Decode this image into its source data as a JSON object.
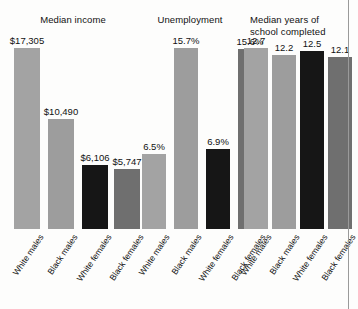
{
  "figure": {
    "background_color": "#fdfdfc",
    "rule_color": "#9a9a9a",
    "text_color": "#111111"
  },
  "categories": [
    "White males",
    "Black males",
    "White females",
    "Black females"
  ],
  "bar_colors": [
    "#a3a3a3",
    "#9d9d9d",
    "#161616",
    "#6f6f6f"
  ],
  "panels": [
    {
      "title": "Median income",
      "title_line2": "",
      "values": [
        17305,
        10490,
        6106,
        5747
      ],
      "labels": [
        "$17,305",
        "$10,490",
        "$6,106",
        "$5,747"
      ],
      "max": 17305
    },
    {
      "title": "Unemployment",
      "title_line2": "",
      "values": [
        6.5,
        15.7,
        6.9,
        15.6
      ],
      "labels": [
        "6.5%",
        "15.7%",
        "6.9%",
        "15.6%"
      ],
      "max": 15.7
    },
    {
      "title": "Median years of",
      "title_line2": "school completed",
      "values": [
        12.7,
        12.2,
        12.5,
        12.1
      ],
      "labels": [
        "12.7",
        "12.2",
        "12.5",
        "12.1"
      ],
      "max": 12.7
    }
  ],
  "chart_data": {
    "type": "bar",
    "title": "",
    "categories": [
      "White males",
      "Black males",
      "White females",
      "Black females"
    ],
    "panels": [
      {
        "title": "Median income",
        "unit": "USD",
        "values": [
          17305,
          10490,
          6106,
          5747
        ],
        "data_labels": [
          "$17,305",
          "$10,490",
          "$6,106",
          "$5,747"
        ],
        "ylim": [
          0,
          17305
        ],
        "grid": false
      },
      {
        "title": "Unemployment",
        "unit": "percent",
        "values": [
          6.5,
          15.7,
          6.9,
          15.6
        ],
        "data_labels": [
          "6.5%",
          "15.7%",
          "6.9%",
          "15.6%"
        ],
        "ylim": [
          0,
          15.7
        ],
        "grid": false
      },
      {
        "title": "Median years of school completed",
        "unit": "years",
        "values": [
          12.7,
          12.2,
          12.5,
          12.1
        ],
        "data_labels": [
          "12.7",
          "12.2",
          "12.5",
          "12.1"
        ],
        "ylim": [
          0,
          12.7
        ],
        "grid": false
      }
    ],
    "xlabel": "",
    "ylabel": "",
    "legend": [],
    "legend_position": "none",
    "series_colors": [
      "#a3a3a3",
      "#9d9d9d",
      "#161616",
      "#6f6f6f"
    ]
  }
}
